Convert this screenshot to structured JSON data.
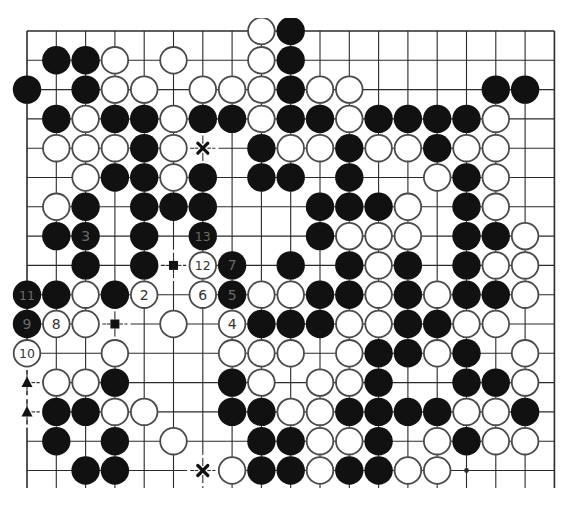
{
  "board": {
    "name": "go-board-diagram",
    "size": 19,
    "visible_rows": 16,
    "colors": {
      "line": "#2a2a2a",
      "black_stone": "#111111",
      "white_stone": "#ffffff",
      "stone_outline": "#4a4a4a",
      "label_on_black": "#6a6a6a",
      "label_on_white": "#333333"
    },
    "stones": [
      {
        "r": 0,
        "c": 8,
        "color": "white"
      },
      {
        "r": 0,
        "c": 9,
        "color": "black"
      },
      {
        "r": 1,
        "c": 1,
        "color": "black"
      },
      {
        "r": 1,
        "c": 2,
        "color": "black"
      },
      {
        "r": 1,
        "c": 3,
        "color": "white"
      },
      {
        "r": 1,
        "c": 5,
        "color": "white"
      },
      {
        "r": 1,
        "c": 8,
        "color": "white"
      },
      {
        "r": 1,
        "c": 9,
        "color": "black"
      },
      {
        "r": 2,
        "c": 0,
        "color": "black"
      },
      {
        "r": 2,
        "c": 2,
        "color": "black"
      },
      {
        "r": 2,
        "c": 3,
        "color": "white"
      },
      {
        "r": 2,
        "c": 4,
        "color": "white"
      },
      {
        "r": 2,
        "c": 6,
        "color": "white"
      },
      {
        "r": 2,
        "c": 7,
        "color": "white"
      },
      {
        "r": 2,
        "c": 8,
        "color": "white"
      },
      {
        "r": 2,
        "c": 9,
        "color": "black"
      },
      {
        "r": 2,
        "c": 10,
        "color": "white"
      },
      {
        "r": 2,
        "c": 11,
        "color": "white"
      },
      {
        "r": 2,
        "c": 16,
        "color": "black"
      },
      {
        "r": 2,
        "c": 17,
        "color": "black"
      },
      {
        "r": 3,
        "c": 1,
        "color": "black"
      },
      {
        "r": 3,
        "c": 2,
        "color": "white"
      },
      {
        "r": 3,
        "c": 3,
        "color": "black"
      },
      {
        "r": 3,
        "c": 4,
        "color": "black"
      },
      {
        "r": 3,
        "c": 5,
        "color": "white"
      },
      {
        "r": 3,
        "c": 6,
        "color": "black"
      },
      {
        "r": 3,
        "c": 7,
        "color": "black"
      },
      {
        "r": 3,
        "c": 8,
        "color": "white"
      },
      {
        "r": 3,
        "c": 9,
        "color": "black"
      },
      {
        "r": 3,
        "c": 10,
        "color": "black"
      },
      {
        "r": 3,
        "c": 11,
        "color": "white"
      },
      {
        "r": 3,
        "c": 12,
        "color": "black"
      },
      {
        "r": 3,
        "c": 13,
        "color": "black"
      },
      {
        "r": 3,
        "c": 14,
        "color": "black"
      },
      {
        "r": 3,
        "c": 15,
        "color": "black"
      },
      {
        "r": 3,
        "c": 16,
        "color": "white"
      },
      {
        "r": 4,
        "c": 1,
        "color": "white"
      },
      {
        "r": 4,
        "c": 2,
        "color": "white"
      },
      {
        "r": 4,
        "c": 3,
        "color": "white"
      },
      {
        "r": 4,
        "c": 4,
        "color": "black"
      },
      {
        "r": 4,
        "c": 5,
        "color": "white"
      },
      {
        "r": 4,
        "c": 8,
        "color": "black"
      },
      {
        "r": 4,
        "c": 9,
        "color": "white"
      },
      {
        "r": 4,
        "c": 10,
        "color": "white"
      },
      {
        "r": 4,
        "c": 11,
        "color": "black"
      },
      {
        "r": 4,
        "c": 12,
        "color": "white"
      },
      {
        "r": 4,
        "c": 13,
        "color": "white"
      },
      {
        "r": 4,
        "c": 14,
        "color": "black"
      },
      {
        "r": 4,
        "c": 15,
        "color": "white"
      },
      {
        "r": 4,
        "c": 16,
        "color": "white"
      },
      {
        "r": 5,
        "c": 2,
        "color": "white"
      },
      {
        "r": 5,
        "c": 3,
        "color": "black"
      },
      {
        "r": 5,
        "c": 4,
        "color": "black"
      },
      {
        "r": 5,
        "c": 5,
        "color": "white"
      },
      {
        "r": 5,
        "c": 6,
        "color": "black"
      },
      {
        "r": 5,
        "c": 8,
        "color": "black"
      },
      {
        "r": 5,
        "c": 9,
        "color": "black"
      },
      {
        "r": 5,
        "c": 11,
        "color": "black"
      },
      {
        "r": 5,
        "c": 14,
        "color": "white"
      },
      {
        "r": 5,
        "c": 15,
        "color": "black"
      },
      {
        "r": 5,
        "c": 16,
        "color": "white"
      },
      {
        "r": 6,
        "c": 1,
        "color": "white"
      },
      {
        "r": 6,
        "c": 2,
        "color": "black"
      },
      {
        "r": 6,
        "c": 4,
        "color": "black"
      },
      {
        "r": 6,
        "c": 5,
        "color": "black"
      },
      {
        "r": 6,
        "c": 6,
        "color": "black"
      },
      {
        "r": 6,
        "c": 10,
        "color": "black"
      },
      {
        "r": 6,
        "c": 11,
        "color": "black"
      },
      {
        "r": 6,
        "c": 12,
        "color": "black"
      },
      {
        "r": 6,
        "c": 13,
        "color": "white"
      },
      {
        "r": 6,
        "c": 15,
        "color": "black"
      },
      {
        "r": 6,
        "c": 16,
        "color": "white"
      },
      {
        "r": 7,
        "c": 1,
        "color": "black"
      },
      {
        "r": 7,
        "c": 2,
        "color": "black",
        "label": "3"
      },
      {
        "r": 7,
        "c": 4,
        "color": "black"
      },
      {
        "r": 7,
        "c": 6,
        "color": "black",
        "label": "13"
      },
      {
        "r": 7,
        "c": 10,
        "color": "black"
      },
      {
        "r": 7,
        "c": 11,
        "color": "white"
      },
      {
        "r": 7,
        "c": 12,
        "color": "white"
      },
      {
        "r": 7,
        "c": 13,
        "color": "white"
      },
      {
        "r": 7,
        "c": 15,
        "color": "black"
      },
      {
        "r": 7,
        "c": 16,
        "color": "black"
      },
      {
        "r": 7,
        "c": 17,
        "color": "white"
      },
      {
        "r": 8,
        "c": 2,
        "color": "black"
      },
      {
        "r": 8,
        "c": 4,
        "color": "black"
      },
      {
        "r": 8,
        "c": 6,
        "color": "white",
        "label": "12"
      },
      {
        "r": 8,
        "c": 7,
        "color": "black",
        "label": "7"
      },
      {
        "r": 8,
        "c": 9,
        "color": "black"
      },
      {
        "r": 8,
        "c": 11,
        "color": "black"
      },
      {
        "r": 8,
        "c": 12,
        "color": "white"
      },
      {
        "r": 8,
        "c": 13,
        "color": "black"
      },
      {
        "r": 8,
        "c": 15,
        "color": "black"
      },
      {
        "r": 8,
        "c": 16,
        "color": "white"
      },
      {
        "r": 8,
        "c": 17,
        "color": "white"
      },
      {
        "r": 9,
        "c": 0,
        "color": "black",
        "label": "11"
      },
      {
        "r": 9,
        "c": 1,
        "color": "black"
      },
      {
        "r": 9,
        "c": 2,
        "color": "white"
      },
      {
        "r": 9,
        "c": 3,
        "color": "black"
      },
      {
        "r": 9,
        "c": 4,
        "color": "white",
        "label": "2"
      },
      {
        "r": 9,
        "c": 6,
        "color": "white",
        "label": "6"
      },
      {
        "r": 9,
        "c": 7,
        "color": "black",
        "label": "5"
      },
      {
        "r": 9,
        "c": 8,
        "color": "white"
      },
      {
        "r": 9,
        "c": 9,
        "color": "white"
      },
      {
        "r": 9,
        "c": 10,
        "color": "black"
      },
      {
        "r": 9,
        "c": 11,
        "color": "black"
      },
      {
        "r": 9,
        "c": 12,
        "color": "white"
      },
      {
        "r": 9,
        "c": 13,
        "color": "black"
      },
      {
        "r": 9,
        "c": 14,
        "color": "white"
      },
      {
        "r": 9,
        "c": 15,
        "color": "black"
      },
      {
        "r": 9,
        "c": 16,
        "color": "black"
      },
      {
        "r": 9,
        "c": 17,
        "color": "white"
      },
      {
        "r": 10,
        "c": 0,
        "color": "black",
        "label": "9"
      },
      {
        "r": 10,
        "c": 1,
        "color": "white",
        "label": "8"
      },
      {
        "r": 10,
        "c": 2,
        "color": "white"
      },
      {
        "r": 10,
        "c": 5,
        "color": "white"
      },
      {
        "r": 10,
        "c": 7,
        "color": "white",
        "label": "4"
      },
      {
        "r": 10,
        "c": 8,
        "color": "black"
      },
      {
        "r": 10,
        "c": 9,
        "color": "black"
      },
      {
        "r": 10,
        "c": 10,
        "color": "black"
      },
      {
        "r": 10,
        "c": 11,
        "color": "white"
      },
      {
        "r": 10,
        "c": 12,
        "color": "white"
      },
      {
        "r": 10,
        "c": 13,
        "color": "black"
      },
      {
        "r": 10,
        "c": 14,
        "color": "black"
      },
      {
        "r": 10,
        "c": 15,
        "color": "white"
      },
      {
        "r": 10,
        "c": 16,
        "color": "white"
      },
      {
        "r": 11,
        "c": 0,
        "color": "white",
        "label": "10"
      },
      {
        "r": 11,
        "c": 3,
        "color": "white"
      },
      {
        "r": 11,
        "c": 7,
        "color": "white"
      },
      {
        "r": 11,
        "c": 8,
        "color": "white"
      },
      {
        "r": 11,
        "c": 9,
        "color": "white"
      },
      {
        "r": 11,
        "c": 11,
        "color": "white"
      },
      {
        "r": 11,
        "c": 12,
        "color": "black"
      },
      {
        "r": 11,
        "c": 13,
        "color": "black"
      },
      {
        "r": 11,
        "c": 14,
        "color": "white"
      },
      {
        "r": 11,
        "c": 15,
        "color": "black"
      },
      {
        "r": 11,
        "c": 17,
        "color": "white"
      },
      {
        "r": 12,
        "c": 1,
        "color": "white"
      },
      {
        "r": 12,
        "c": 2,
        "color": "white"
      },
      {
        "r": 12,
        "c": 3,
        "color": "black"
      },
      {
        "r": 12,
        "c": 7,
        "color": "black"
      },
      {
        "r": 12,
        "c": 8,
        "color": "white"
      },
      {
        "r": 12,
        "c": 10,
        "color": "white"
      },
      {
        "r": 12,
        "c": 11,
        "color": "white"
      },
      {
        "r": 12,
        "c": 12,
        "color": "black"
      },
      {
        "r": 12,
        "c": 15,
        "color": "black"
      },
      {
        "r": 12,
        "c": 16,
        "color": "black"
      },
      {
        "r": 12,
        "c": 17,
        "color": "white"
      },
      {
        "r": 13,
        "c": 1,
        "color": "black"
      },
      {
        "r": 13,
        "c": 2,
        "color": "black"
      },
      {
        "r": 13,
        "c": 3,
        "color": "white"
      },
      {
        "r": 13,
        "c": 4,
        "color": "white"
      },
      {
        "r": 13,
        "c": 7,
        "color": "black"
      },
      {
        "r": 13,
        "c": 8,
        "color": "black"
      },
      {
        "r": 13,
        "c": 9,
        "color": "white"
      },
      {
        "r": 13,
        "c": 10,
        "color": "white"
      },
      {
        "r": 13,
        "c": 11,
        "color": "black"
      },
      {
        "r": 13,
        "c": 12,
        "color": "black"
      },
      {
        "r": 13,
        "c": 13,
        "color": "black"
      },
      {
        "r": 13,
        "c": 14,
        "color": "black"
      },
      {
        "r": 13,
        "c": 15,
        "color": "white"
      },
      {
        "r": 13,
        "c": 16,
        "color": "white"
      },
      {
        "r": 13,
        "c": 17,
        "color": "black"
      },
      {
        "r": 14,
        "c": 1,
        "color": "black"
      },
      {
        "r": 14,
        "c": 3,
        "color": "black"
      },
      {
        "r": 14,
        "c": 5,
        "color": "white"
      },
      {
        "r": 14,
        "c": 8,
        "color": "black"
      },
      {
        "r": 14,
        "c": 9,
        "color": "black"
      },
      {
        "r": 14,
        "c": 10,
        "color": "white"
      },
      {
        "r": 14,
        "c": 11,
        "color": "white"
      },
      {
        "r": 14,
        "c": 12,
        "color": "black"
      },
      {
        "r": 14,
        "c": 14,
        "color": "white"
      },
      {
        "r": 14,
        "c": 15,
        "color": "black"
      },
      {
        "r": 14,
        "c": 16,
        "color": "white"
      },
      {
        "r": 14,
        "c": 17,
        "color": "white"
      },
      {
        "r": 15,
        "c": 2,
        "color": "black"
      },
      {
        "r": 15,
        "c": 3,
        "color": "black"
      },
      {
        "r": 15,
        "c": 7,
        "color": "white"
      },
      {
        "r": 15,
        "c": 8,
        "color": "black"
      },
      {
        "r": 15,
        "c": 9,
        "color": "black"
      },
      {
        "r": 15,
        "c": 10,
        "color": "white"
      },
      {
        "r": 15,
        "c": 11,
        "color": "black"
      },
      {
        "r": 15,
        "c": 12,
        "color": "black"
      },
      {
        "r": 15,
        "c": 13,
        "color": "white"
      },
      {
        "r": 15,
        "c": 14,
        "color": "white"
      }
    ],
    "markers": [
      {
        "r": 4,
        "c": 6,
        "type": "cross"
      },
      {
        "r": 15,
        "c": 6,
        "type": "cross"
      },
      {
        "r": 8,
        "c": 5,
        "type": "square"
      },
      {
        "r": 10,
        "c": 3,
        "type": "square"
      },
      {
        "r": 12,
        "c": 0,
        "type": "triangle"
      },
      {
        "r": 13,
        "c": 0,
        "type": "triangle"
      }
    ],
    "hoshi": [
      {
        "r": 15,
        "c": 15
      }
    ]
  }
}
